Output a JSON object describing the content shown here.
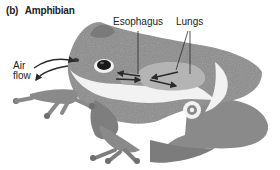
{
  "figure": {
    "panel_letter": "(b)",
    "title": "Amphibian"
  },
  "labels": {
    "esophagus": "Esophagus",
    "lungs": "Lungs",
    "air_flow_line1": "Air",
    "air_flow_line2": "flow"
  },
  "colors": {
    "body": "#8a8a8a",
    "body_dark": "#6e6e6e",
    "belly": "#f2f2f2",
    "lungs": "#b4b4b4",
    "arrow": "#2a2a2a",
    "text": "#222222"
  }
}
